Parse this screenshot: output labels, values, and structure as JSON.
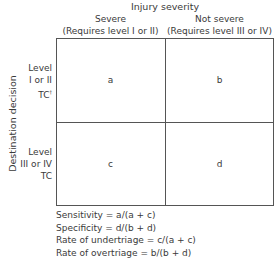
{
  "diagram": {
    "type": "2x2 contingency table",
    "column_axis_title": "Injury severity",
    "columns": [
      {
        "label": "Severe",
        "sublabel": "(Requires level I or II)"
      },
      {
        "label": "Not severe",
        "sublabel": "(Requires level III or IV)"
      }
    ],
    "row_axis_title": "Destination decision",
    "rows": [
      {
        "line1": "Level",
        "line2": "I or II",
        "line3": "TC",
        "footnote": "†"
      },
      {
        "line1": "Level",
        "line2": "III or IV",
        "line3": "TC",
        "footnote": ""
      }
    ],
    "cells": {
      "a": "a",
      "b": "b",
      "c": "c",
      "d": "d"
    },
    "formulas": [
      "Sensitivity = a/(a + c)",
      "Specificity = d/(b + d)",
      "Rate of undertriage = c/(a + c)",
      "Rate of overtriage = b/(b + d)"
    ]
  }
}
